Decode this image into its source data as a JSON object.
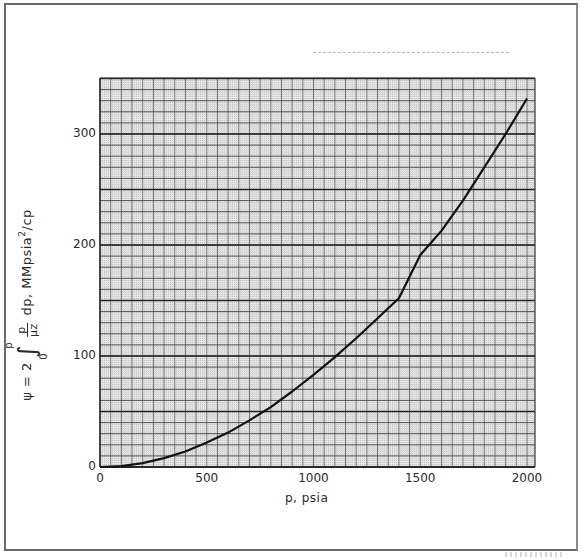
{
  "chart_data": {
    "type": "line",
    "title": "",
    "xlabel": "p, psia",
    "ylabel": "ψ = 2 ∫₀ᵖ p/(μz) dp, MMpsia²/cp",
    "ylabel_parts": {
      "prefix": "ψ = 2",
      "integral_lower": "0",
      "integral_upper": "p",
      "frac_num": "p",
      "frac_den": "μz",
      "suffix": "dp, MMpsia",
      "exp": "2",
      "unit_tail": "/cp"
    },
    "xlim": [
      0,
      2000
    ],
    "ylim": [
      0,
      350
    ],
    "x_ticks": [
      0,
      500,
      1000,
      1500,
      2000
    ],
    "y_ticks": [
      0,
      100,
      200,
      300
    ],
    "grid": true,
    "legend": null,
    "series": [
      {
        "name": "pseudo-pressure ψ",
        "x": [
          0,
          100,
          200,
          300,
          400,
          500,
          600,
          700,
          800,
          900,
          1000,
          1100,
          1200,
          1300,
          1400,
          1500,
          1600,
          1700,
          1800,
          1900,
          2000
        ],
        "y": [
          0,
          0.8,
          3.5,
          8,
          14,
          22,
          31,
          42,
          54,
          68,
          83,
          99,
          116,
          134,
          152,
          191,
          213,
          240,
          270,
          300,
          332
        ]
      }
    ]
  },
  "axes": {
    "y_tick_labels": [
      "0",
      "100",
      "200",
      "300"
    ],
    "x_tick_labels": [
      "0",
      "500",
      "1000",
      "1500",
      "2000"
    ]
  },
  "colors": {
    "curve": "#111111",
    "grid_major": "#3a3a3a",
    "grid_minor": "#9a9a9a",
    "frame": "#6a6a6a"
  }
}
